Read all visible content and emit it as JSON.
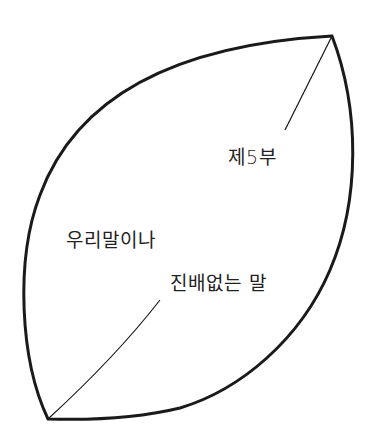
{
  "page": {
    "part_label": "제5부",
    "section_title": "우리말이나",
    "subtitle": "진배없는 말"
  },
  "colors": {
    "outline": "#1a1a1a",
    "text": "#222222",
    "background": "#ffffff"
  }
}
